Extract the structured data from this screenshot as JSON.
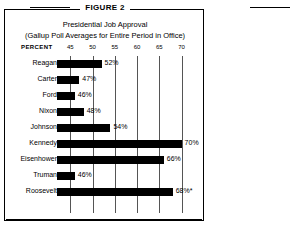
{
  "figure": {
    "label": "FIGURE 2",
    "title_line1": "Presidential Job Approval",
    "title_line2": "(Gallup Poll Averages for Entire Period in Office)",
    "percent_label": "PERCENT"
  },
  "chart_data": {
    "type": "bar",
    "orientation": "horizontal",
    "title": "Presidential Job Approval",
    "subtitle": "(Gallup Poll Averages for Entire Period in Office)",
    "xlabel": "PERCENT",
    "ylabel": "",
    "grid": true,
    "legend": "none",
    "xlim": [
      42,
      71.5
    ],
    "xticks": [
      45,
      50,
      55,
      60,
      65,
      70
    ],
    "xtick_labels": [
      "45",
      "50",
      "55",
      "60",
      "65",
      "70"
    ],
    "categories": [
      "Reagan",
      "Carter",
      "Ford",
      "Nixon",
      "Johnson",
      "Kennedy",
      "Eisenhower",
      "Truman",
      "Roosevelt"
    ],
    "values": [
      52,
      47,
      46,
      48,
      54,
      70,
      66,
      46,
      68
    ],
    "data_labels": [
      "52%",
      "47%",
      "46%",
      "48%",
      "54%",
      "70%",
      "66%",
      "46%",
      "68%*"
    ],
    "bar_color": "#000000",
    "annotations": [
      "* asterisk on Roosevelt value"
    ]
  }
}
